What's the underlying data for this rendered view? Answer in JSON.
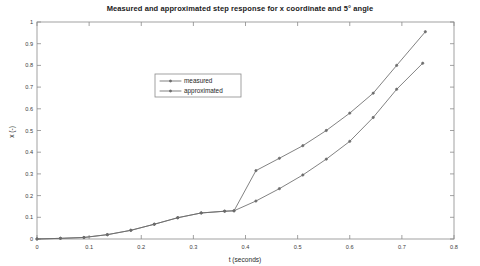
{
  "chart_data": {
    "type": "line",
    "title": "Measured and approximated step response for x coordinate and 5° angle",
    "xlabel": "t (seconds)",
    "ylabel": "x (-)",
    "xlim": [
      0,
      0.8
    ],
    "ylim": [
      0,
      1
    ],
    "grid": false,
    "legend_position": "upper-left-inside",
    "xticks": [
      0,
      0.1,
      0.2,
      0.3,
      0.4,
      0.5,
      0.6,
      0.7,
      0.8
    ],
    "xticklabels": [
      "0",
      "0.1",
      "0.2",
      "0.3",
      "0.4",
      "0.5",
      "0.6",
      "0.7",
      "0.8"
    ],
    "yticks": [
      0,
      0.1,
      0.2,
      0.3,
      0.4,
      0.5,
      0.6,
      0.7,
      0.8,
      0.9,
      1
    ],
    "yticklabels": [
      "0",
      "0.1",
      "0.2",
      "0.3",
      "0.4",
      "0.5",
      "0.6",
      "0.7",
      "0.8",
      "0.9",
      "1"
    ],
    "series": [
      {
        "name": "measured",
        "color": "#6b6b6b",
        "marker": "dot",
        "x": [
          0.0,
          0.045,
          0.09,
          0.135,
          0.18,
          0.225,
          0.27,
          0.315,
          0.36,
          0.378,
          0.42,
          0.465,
          0.51,
          0.555,
          0.6,
          0.645,
          0.69,
          0.745
        ],
        "y": [
          0.0,
          0.003,
          0.007,
          0.02,
          0.04,
          0.068,
          0.098,
          0.12,
          0.128,
          0.13,
          0.315,
          0.372,
          0.43,
          0.5,
          0.58,
          0.672,
          0.8,
          0.955
        ]
      },
      {
        "name": "approximated",
        "color": "#6b6b6b",
        "marker": "dot",
        "x": [
          0.0,
          0.045,
          0.09,
          0.135,
          0.18,
          0.225,
          0.27,
          0.315,
          0.36,
          0.378,
          0.42,
          0.465,
          0.51,
          0.555,
          0.6,
          0.645,
          0.69,
          0.74
        ],
        "y": [
          0.0,
          0.003,
          0.007,
          0.02,
          0.04,
          0.068,
          0.098,
          0.12,
          0.128,
          0.13,
          0.175,
          0.232,
          0.295,
          0.368,
          0.45,
          0.56,
          0.69,
          0.81
        ]
      }
    ],
    "legend_entries": [
      "measured",
      "approximated"
    ]
  }
}
